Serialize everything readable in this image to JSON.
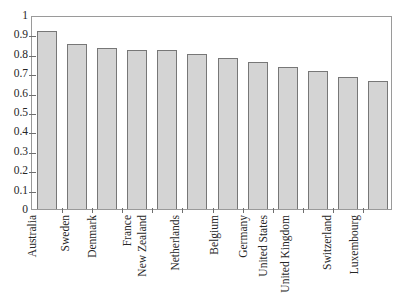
{
  "chart_data": {
    "type": "bar",
    "title": "",
    "subtitle": "",
    "xlabel": "",
    "ylabel": "",
    "ylim": [
      0,
      1
    ],
    "grid": false,
    "legend": null,
    "orientation": "vertical",
    "categories": [
      "Australia",
      "Sweden",
      "Denmark",
      "France",
      "New Zealand",
      "Netherlands",
      "Belgium",
      "Germany",
      "United States",
      "United Kingdom",
      "Switzerland",
      "Luxembourg"
    ],
    "values": [
      0.92,
      0.85,
      0.83,
      0.82,
      0.82,
      0.8,
      0.78,
      0.76,
      0.73,
      0.71,
      0.68,
      0.66
    ],
    "ytick_labels": [
      "0",
      "0.1",
      "0.2",
      "0.3",
      "0.4",
      "0.5",
      "0.6",
      "0.7",
      "0.8",
      "0.9",
      "1"
    ],
    "ytick_values": [
      0,
      0.1,
      0.2,
      0.3,
      0.4,
      0.5,
      0.6,
      0.7,
      0.8,
      0.9,
      1
    ],
    "colors": {
      "bar_fill": "#d4d4d4",
      "bar_border": "#777777",
      "axis": "#9a9a9a",
      "tick": "#6f6f6f",
      "text": "#262626",
      "background": "#ffffff"
    },
    "x_label_rotation": 90
  }
}
